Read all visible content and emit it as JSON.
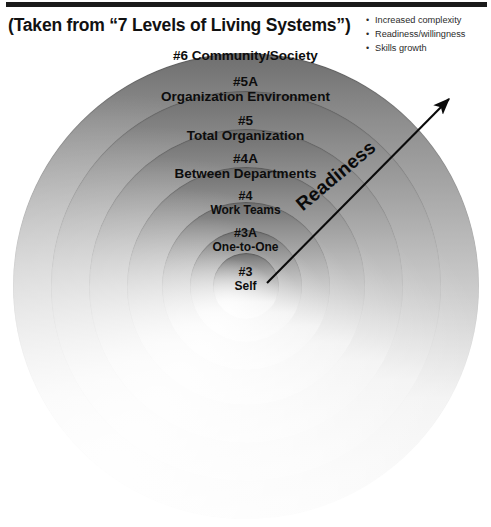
{
  "slide": {
    "headline": "(Taken from “7 Levels of Living Systems”)",
    "bullets": [
      "Increased complexity",
      "Readiness/willingness",
      "Skills growth"
    ],
    "bullet_glyph": "•"
  },
  "diagram": {
    "type": "concentric-rings",
    "arrow_label": "Readiness",
    "arrow": {
      "from": "#3 Self (center)",
      "to": "#6 Community/Society (outer, upper-right)",
      "direction": "outward"
    },
    "center": {
      "x": 246,
      "y": 286
    },
    "rings": [
      {
        "index": 6,
        "number": "#6",
        "name": "Community/Society",
        "radius": 233,
        "label_y": 48,
        "label_outside": true
      },
      {
        "index": 5,
        "number": "#5A",
        "name": "Organization Environment",
        "radius": 195,
        "label_y": 74
      },
      {
        "index": 4,
        "number": "#5",
        "name": "Total Organization",
        "radius": 157,
        "label_y": 113
      },
      {
        "index": 3,
        "number": "#4A",
        "name": "Between Departments",
        "radius": 119,
        "label_y": 151
      },
      {
        "index": 2,
        "number": "#4",
        "name": "Work Teams",
        "radius": 84,
        "label_y": 189
      },
      {
        "index": 1,
        "number": "#3A",
        "name": "One-to-One",
        "radius": 56,
        "label_y": 226
      },
      {
        "index": 0,
        "number": "#3",
        "name": "Self",
        "radius": 33,
        "label_y": 265
      }
    ]
  },
  "colors": {
    "rule": "#1a1a1a",
    "text": "#0d0d0d",
    "bullet_text": "#2b2b2b",
    "ring_dark": "#6e6e6e",
    "ring_light": "#f2f2f2",
    "arrow": "#0a0a0a",
    "background": "#ffffff"
  }
}
